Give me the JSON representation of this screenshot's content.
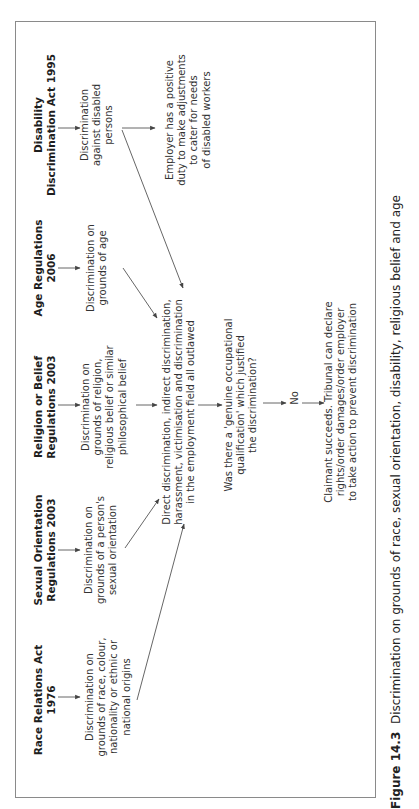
{
  "orientation": "rotated-90-ccw",
  "columns": [
    {
      "id": "disability",
      "header": [
        "Disability",
        "Discrimination Act 1995"
      ],
      "description": [
        "Discrimination",
        "against disabled",
        "persons"
      ]
    },
    {
      "id": "age",
      "header": [
        "Age Regulations",
        "2006"
      ],
      "description": [
        "Discrimination on",
        "grounds of age"
      ]
    },
    {
      "id": "religion",
      "header": [
        "Religion or Belief",
        "Regulations 2003"
      ],
      "description": [
        "Discrimination on",
        "grounds of religion,",
        "religious belief or similar",
        "philosophical belief"
      ]
    },
    {
      "id": "sexual-orientation",
      "header": [
        "Sexual Orientation",
        "Regulations 2003"
      ],
      "description": [
        "Discrimination on",
        "grounds of a person's",
        "sexual orientation"
      ]
    },
    {
      "id": "race",
      "header": [
        "Race Relations Act",
        "1976"
      ],
      "description": [
        "Discrimination on",
        "grounds of race, colour,",
        "nationality or ethnic or",
        "national origins"
      ]
    }
  ],
  "employer_duty": [
    "Employer has a positive",
    "duty to make adjustments",
    "to cater for needs",
    "of disabled workers"
  ],
  "outlawed": [
    "Direct discrimination, indirect discrimination,",
    "harassment, victimisation and discrimination",
    "in the employment field all outlawed"
  ],
  "question": [
    "Was there a 'genuine occupational",
    "qualification' which justified",
    "the discrimination?"
  ],
  "answer": "No",
  "outcome": [
    "Claimant succeeds. Tribunal can declare",
    "rights/order damages/order employer",
    "to take action to prevent discrimination"
  ],
  "caption": {
    "label": "Figure 14.3",
    "text": "Discrimination on grounds of race, sexual orientation, disability, religious belief and age"
  },
  "colors": {
    "line": "#555555",
    "frame": "#8a8a8a",
    "text": "#2a2a2a"
  }
}
